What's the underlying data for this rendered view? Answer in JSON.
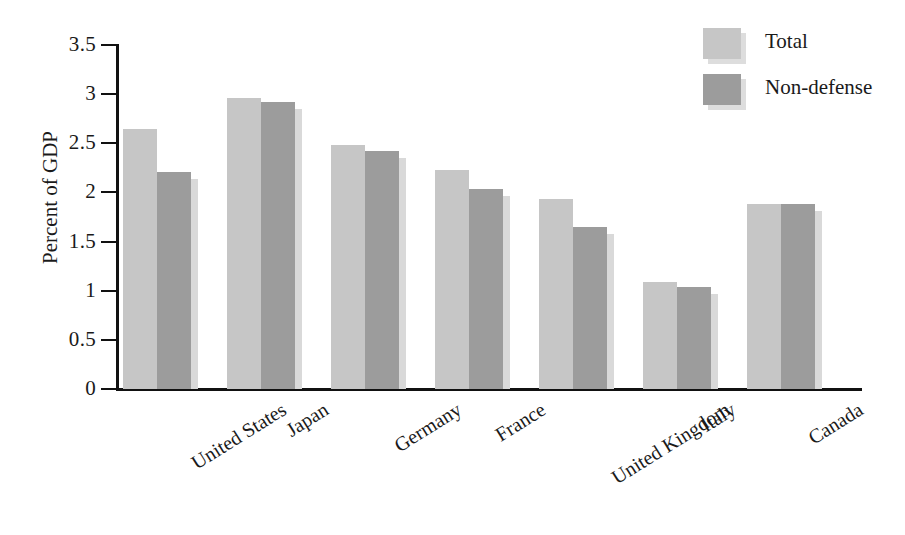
{
  "chart_data": {
    "type": "bar",
    "title": "",
    "subtitle": "",
    "xlabel": "",
    "ylabel": "Percent of GDP",
    "ylim": [
      0,
      3.5
    ],
    "yticks": [
      "0",
      "0.5",
      "1",
      "1.5",
      "2",
      "2.5",
      "3",
      "3.5"
    ],
    "ytick_values": [
      0,
      0.5,
      1,
      1.5,
      2,
      2.5,
      3,
      3.5
    ],
    "grid": false,
    "legend_position": "top-right",
    "categories": [
      "United States",
      "Japan",
      "Germany",
      "France",
      "United Kingdom",
      "Italy",
      "Canada"
    ],
    "series": [
      {
        "name": "Total",
        "color": "#c6c6c6",
        "values": [
          2.65,
          2.96,
          2.48,
          2.23,
          1.93,
          1.09,
          1.88
        ]
      },
      {
        "name": "Non-defense",
        "color": "#9c9c9c",
        "values": [
          2.21,
          2.92,
          2.42,
          2.03,
          1.65,
          1.04,
          1.88
        ]
      }
    ]
  },
  "legend": {
    "items": [
      {
        "label": "Total",
        "color": "#c6c6c6"
      },
      {
        "label": "Non-defense",
        "color": "#9c9c9c"
      }
    ]
  },
  "axes": {
    "y_title": "Percent of GDP"
  }
}
